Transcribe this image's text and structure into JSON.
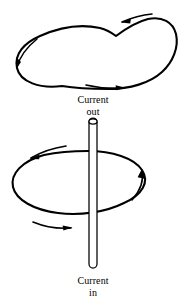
{
  "figure": {
    "background_color": "#ffffff",
    "ink_color": "#000000",
    "width": 186,
    "height": 304
  },
  "labels": {
    "top": {
      "line1": "Current",
      "line2": "out"
    },
    "bottom": {
      "line1": "Current",
      "line2": "in"
    }
  },
  "wire": {
    "name": "vertical-current-carrying-rod",
    "orientation": "vertical",
    "top_y": 118,
    "bottom_y": 268,
    "center_x": 93,
    "width": 8,
    "cap_style": "rounded",
    "stroke_color": "#000000"
  },
  "loops": [
    {
      "name": "upper-field-loop",
      "shape": "bean",
      "position": "above-wire-tip",
      "stroke_color": "#000000",
      "stroke_width": 2.1,
      "arrow_count": 3
    },
    {
      "name": "lower-field-loop",
      "shape": "tilted-ellipse",
      "position": "encircling-wire",
      "stroke_color": "#000000",
      "stroke_width": 2.1,
      "arrow_count": 3
    }
  ],
  "arrows": [
    {
      "name": "upper-loop-top-arrow",
      "direction": "left"
    },
    {
      "name": "upper-loop-left-arrow",
      "direction": "down-left"
    },
    {
      "name": "upper-loop-bottom-arrow",
      "direction": "right"
    },
    {
      "name": "lower-loop-top-left-arrow",
      "direction": "left"
    },
    {
      "name": "lower-loop-right-arrow",
      "direction": "up"
    },
    {
      "name": "lower-loop-bottom-arrow",
      "direction": "right"
    }
  ]
}
